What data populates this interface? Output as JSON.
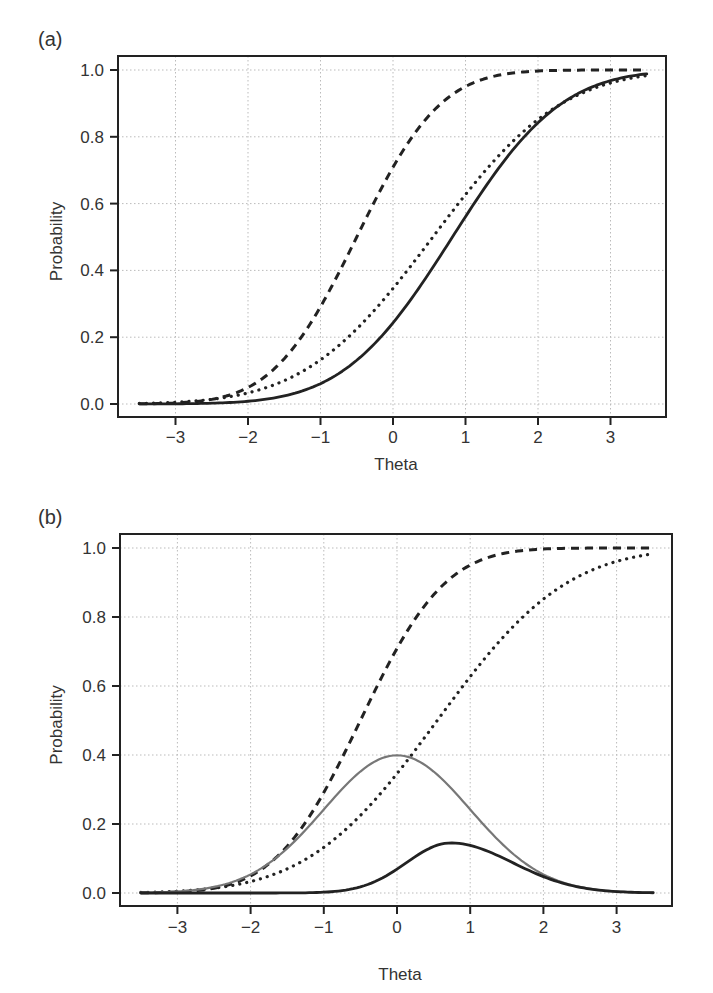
{
  "figure": {
    "panels": [
      {
        "label": "(a)",
        "xlabel": "Theta",
        "ylabel": "Probability"
      },
      {
        "label": "(b)",
        "xlabel": "Theta",
        "ylabel": "Probability"
      }
    ]
  },
  "chart_data": [
    {
      "type": "line",
      "panel": "(a)",
      "title": "",
      "xlabel": "Theta",
      "ylabel": "Probability",
      "xlim": [
        -3.5,
        3.5
      ],
      "ylim": [
        0.0,
        1.0
      ],
      "x_ticks": [
        -3,
        -2,
        -1,
        0,
        1,
        2,
        3
      ],
      "x_tick_labels": [
        "−3",
        "−2",
        "−1",
        "0",
        "1",
        "2",
        "3"
      ],
      "y_ticks": [
        0.0,
        0.2,
        0.4,
        0.6,
        0.8,
        1.0
      ],
      "y_tick_labels": [
        "0.0",
        "0.2",
        "0.4",
        "0.6",
        "0.8",
        "1.0"
      ],
      "grid": true,
      "legend": null,
      "x": [
        -3.5,
        -3,
        -2,
        -1,
        0,
        1,
        2,
        3,
        3.5
      ],
      "series": [
        {
          "name": "dashed",
          "style": "dashed",
          "color": "#222222",
          "model": {
            "kind": "ogive",
            "a": 1.1,
            "b": -0.5
          },
          "values": [
            0.0005,
            0.003,
            0.049,
            0.29,
            0.71,
            0.951,
            0.997,
            1.0,
            1.0
          ]
        },
        {
          "name": "dotted",
          "style": "dotted",
          "color": "#222222",
          "model": {
            "kind": "ogive",
            "a": 0.72,
            "b": 0.55
          },
          "values": [
            0.002,
            0.005,
            0.033,
            0.132,
            0.345,
            0.627,
            0.851,
            0.961,
            0.983
          ]
        },
        {
          "name": "solid",
          "style": "solid",
          "color": "#222222",
          "model": {
            "kind": "ogive",
            "a": 0.85,
            "b": 0.82
          },
          "values": [
            0.0001,
            0.0003,
            0.006,
            0.061,
            0.242,
            0.561,
            0.84,
            0.973,
            0.989
          ]
        }
      ]
    },
    {
      "type": "line",
      "panel": "(b)",
      "title": "",
      "xlabel": "Theta",
      "ylabel": "Probability",
      "xlim": [
        -3.5,
        3.5
      ],
      "ylim": [
        0.0,
        1.0
      ],
      "x_ticks": [
        -3,
        -2,
        -1,
        0,
        1,
        2,
        3
      ],
      "x_tick_labels": [
        "−3",
        "−2",
        "−1",
        "0",
        "1",
        "2",
        "3"
      ],
      "y_ticks": [
        0.0,
        0.2,
        0.4,
        0.6,
        0.8,
        1.0
      ],
      "y_tick_labels": [
        "0.0",
        "0.2",
        "0.4",
        "0.6",
        "0.8",
        "1.0"
      ],
      "grid": true,
      "legend": null,
      "x": [
        -3.5,
        -3,
        -2,
        -1,
        0,
        1,
        2,
        3,
        3.5
      ],
      "series": [
        {
          "name": "dashed",
          "style": "dashed",
          "color": "#222222",
          "model": {
            "kind": "ogive",
            "a": 1.1,
            "b": -0.5
          },
          "values": [
            0.0005,
            0.003,
            0.049,
            0.29,
            0.71,
            0.951,
            0.997,
            1.0,
            1.0
          ]
        },
        {
          "name": "dotted",
          "style": "dotted",
          "color": "#222222",
          "model": {
            "kind": "ogive",
            "a": 0.72,
            "b": 0.55
          },
          "values": [
            0.002,
            0.005,
            0.033,
            0.132,
            0.345,
            0.627,
            0.851,
            0.961,
            0.983
          ]
        },
        {
          "name": "gray-solid",
          "style": "solid",
          "color": "#777777",
          "model": {
            "kind": "normal-density",
            "peak": 0.399,
            "mu": 0,
            "sigma": 1
          },
          "values": [
            0.0009,
            0.0044,
            0.054,
            0.242,
            0.399,
            0.242,
            0.054,
            0.0044,
            0.0009
          ]
        },
        {
          "name": "black-solid",
          "style": "solid",
          "color": "#222222",
          "model": {
            "kind": "skewed-bump",
            "peak": 0.145,
            "mu": 0.73,
            "sigmaL": 0.6,
            "sigmaR": 0.85
          },
          "values": [
            0.0,
            0.0,
            0.0,
            0.002,
            0.069,
            0.138,
            0.047,
            0.004,
            0.0007
          ]
        }
      ]
    }
  ]
}
